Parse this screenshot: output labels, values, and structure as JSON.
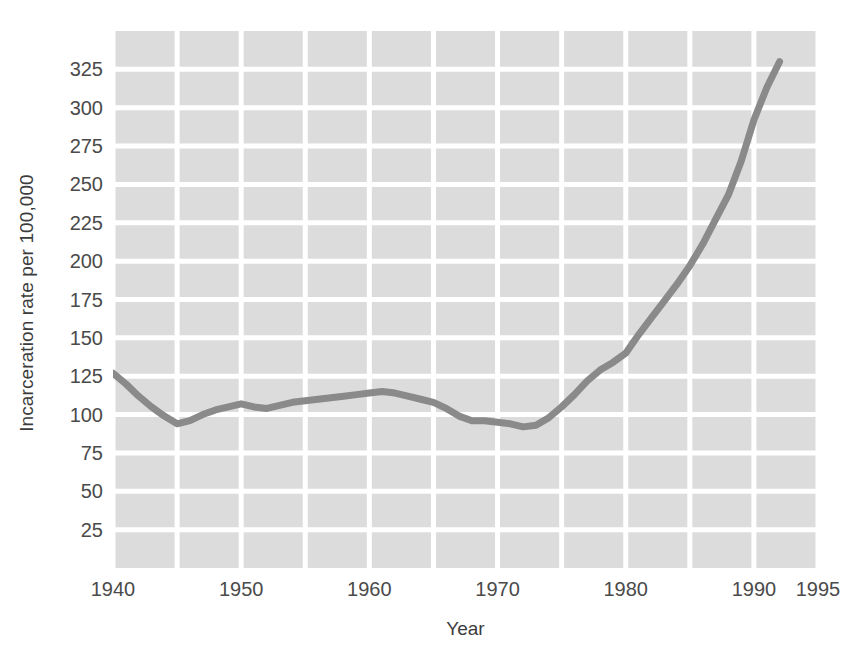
{
  "chart_data": {
    "type": "line",
    "title": "",
    "xlabel": "Year",
    "ylabel": "Incarceration rate per 100,000",
    "xlim": [
      1940,
      1995
    ],
    "ylim": [
      0,
      350
    ],
    "grid": true,
    "legend": "none",
    "x_ticks": [
      "1940",
      "1950",
      "1960",
      "1970",
      "1980",
      "1990",
      "1995"
    ],
    "x_tick_values": [
      1940,
      1950,
      1960,
      1970,
      1980,
      1990,
      1995
    ],
    "y_ticks": [
      "25",
      "50",
      "75",
      "100",
      "125",
      "150",
      "175",
      "200",
      "225",
      "250",
      "275",
      "300",
      "325"
    ],
    "y_tick_values": [
      25,
      50,
      75,
      100,
      125,
      150,
      175,
      200,
      225,
      250,
      275,
      300,
      325
    ],
    "x_gridline_values": [
      1940,
      1945,
      1950,
      1955,
      1960,
      1965,
      1970,
      1975,
      1980,
      1985,
      1990,
      1995
    ],
    "series": [
      {
        "name": "Incarceration rate",
        "color": "#8a8a8a",
        "x": [
          1940,
          1941,
          1942,
          1943,
          1944,
          1945,
          1946,
          1947,
          1948,
          1949,
          1950,
          1951,
          1952,
          1953,
          1954,
          1955,
          1956,
          1957,
          1958,
          1959,
          1960,
          1961,
          1962,
          1963,
          1964,
          1965,
          1966,
          1967,
          1968,
          1969,
          1970,
          1971,
          1972,
          1973,
          1974,
          1975,
          1976,
          1977,
          1978,
          1979,
          1980,
          1981,
          1982,
          1983,
          1984,
          1985,
          1986,
          1987,
          1988,
          1989,
          1990,
          1991,
          1992
        ],
        "values": [
          127,
          120,
          112,
          105,
          99,
          94,
          96,
          100,
          103,
          105,
          107,
          105,
          104,
          106,
          108,
          109,
          110,
          111,
          112,
          113,
          114,
          115,
          114,
          112,
          110,
          108,
          104,
          99,
          96,
          96,
          95,
          94,
          92,
          93,
          98,
          105,
          113,
          122,
          129,
          134,
          140,
          152,
          163,
          174,
          185,
          197,
          211,
          227,
          243,
          265,
          292,
          313,
          330
        ]
      }
    ]
  },
  "colors": {
    "plot_band": "#dcdcdc",
    "gridline": "#ffffff",
    "line": "#8a8a8a",
    "text": "#3c3c3c",
    "background": "#ffffff"
  }
}
